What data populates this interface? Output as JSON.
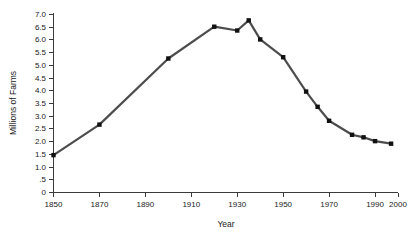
{
  "chart_data": {
    "type": "line",
    "title": "",
    "xlabel": "Year",
    "ylabel": "Millions of Farms",
    "xlim": [
      1850,
      2000
    ],
    "ylim": [
      0,
      7.0
    ],
    "grid": false,
    "legend": "none",
    "line_color": "#4d4d4d",
    "marker_color": "#111111",
    "marker": "square",
    "x_ticks": [
      1850,
      1870,
      1890,
      1910,
      1930,
      1950,
      1970,
      1990,
      2000
    ],
    "x_tick_labels": [
      "1850",
      "1870",
      "1890",
      "1910",
      "1930",
      "1950",
      "1970",
      "1990",
      "2000"
    ],
    "y_ticks": [
      0,
      0.5,
      1.0,
      1.5,
      2.0,
      2.5,
      3.0,
      3.5,
      4.0,
      4.5,
      5.0,
      5.5,
      6.0,
      6.5,
      7.0
    ],
    "y_tick_labels": [
      "0",
      ".5",
      "1.0",
      "1.5",
      "2.0",
      "2.5",
      "3.0",
      "3.5",
      "4.0",
      "4.5",
      "5.0",
      "5.5",
      "6.0",
      "6.5",
      "7.0"
    ],
    "x": [
      1850,
      1870,
      1900,
      1920,
      1930,
      1935,
      1940,
      1950,
      1960,
      1965,
      1970,
      1980,
      1985,
      1990,
      1997
    ],
    "values": [
      1.45,
      2.65,
      5.25,
      6.5,
      6.35,
      6.75,
      6.0,
      5.3,
      3.95,
      3.35,
      2.8,
      2.25,
      2.15,
      2.0,
      1.9
    ],
    "series": [
      {
        "name": "Number of farms in the United States",
        "values": [
          1.45,
          2.65,
          5.25,
          6.5,
          6.35,
          6.75,
          6.0,
          5.3,
          3.95,
          3.35,
          2.8,
          2.25,
          2.15,
          2.0,
          1.9
        ]
      }
    ]
  },
  "axes": {
    "y_axis_title": "Millions of Farms",
    "x_axis_title": "Year"
  }
}
